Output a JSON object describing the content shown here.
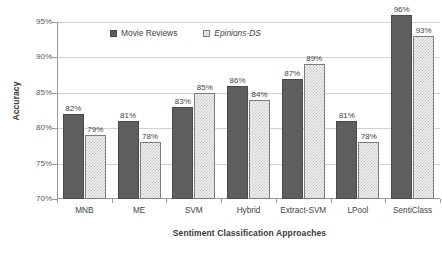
{
  "chart_data": {
    "type": "bar",
    "title": "",
    "subtitle": "",
    "xlabel": "Sentiment Classification Approaches",
    "ylabel": "Accuracy",
    "categories": [
      "MNB",
      "ME",
      "SVM",
      "Hybrid",
      "Extract-SVM",
      "LPool",
      "SentiClass"
    ],
    "series": [
      {
        "name": "Movie Reviews",
        "values": [
          82,
          81,
          83,
          86,
          87,
          81,
          96
        ],
        "labels": [
          "82%",
          "81%",
          "83%",
          "86%",
          "87%",
          "81%",
          "96%"
        ],
        "color": "#5e5e5e",
        "fill": "solid",
        "italic": false
      },
      {
        "name": "Epinions-DS",
        "values": [
          79,
          78,
          85,
          84,
          89,
          78,
          93
        ],
        "labels": [
          "79%",
          "78%",
          "85%",
          "84%",
          "89%",
          "78%",
          "93%"
        ],
        "color": "#c9c9c9",
        "fill": "checkered",
        "italic": true
      }
    ],
    "ylim": [
      70,
      95
    ],
    "yticks": [
      70,
      75,
      80,
      85,
      90,
      95
    ],
    "ytick_labels": [
      "70%",
      "75%",
      "80%",
      "85%",
      "90%",
      "95%"
    ],
    "grid": true,
    "grid_axis": "y",
    "legend_position": "top-center-inside",
    "value_labels": true
  },
  "axes": {
    "y_title": "Accuracy",
    "x_title": "Sentiment Classification Approaches"
  },
  "legend": {
    "items": [
      {
        "label": "Movie Reviews"
      },
      {
        "label": "Epinions-DS"
      }
    ]
  }
}
